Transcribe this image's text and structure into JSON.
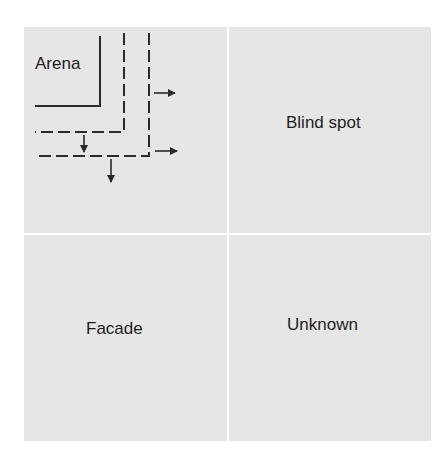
{
  "diagram": {
    "type": "2x2 quadrant window",
    "quadrants": [
      {
        "id": "arena",
        "label": "Arena",
        "position": "top-left"
      },
      {
        "id": "blind_spot",
        "label": "Blind spot",
        "position": "top-right"
      },
      {
        "id": "facade",
        "label": "Facade",
        "position": "bottom-left"
      },
      {
        "id": "unknown",
        "label": "Unknown",
        "position": "bottom-right"
      }
    ],
    "arena_boundary": {
      "style": "solid"
    },
    "expansion_lines": [
      {
        "style": "dashed",
        "order": 1
      },
      {
        "style": "dashed",
        "order": 2
      }
    ],
    "arrows": [
      {
        "direction": "right",
        "count": 2
      },
      {
        "direction": "down",
        "count": 2
      }
    ],
    "colors": {
      "quadrant_fill": "#e6e6e6",
      "divider": "#ffffff",
      "line": "#2a2a2a",
      "text": "#1e1e1e"
    }
  }
}
